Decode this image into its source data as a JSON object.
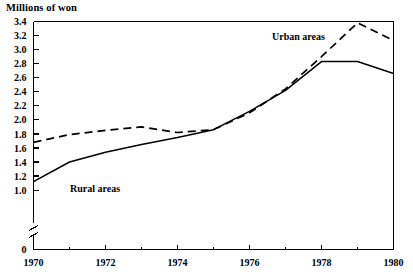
{
  "chart_data": {
    "type": "line",
    "title": "",
    "ylabel": "Millions of won",
    "xlabel": "",
    "xlim": [
      1970,
      1980
    ],
    "ylim": [
      1.0,
      3.4
    ],
    "y_axis_break": true,
    "y_break_between": [
      0,
      1.0
    ],
    "grid": false,
    "legend_position": "inline-annotations",
    "x": [
      1970,
      1971,
      1972,
      1973,
      1974,
      1975,
      1976,
      1977,
      1978,
      1979,
      1980
    ],
    "ytick_labels": [
      "3.4",
      "3.2",
      "3.0",
      "2.8",
      "2.6",
      "2.4",
      "2.2",
      "2.0",
      "1.8",
      "1.6",
      "1.4",
      "1.2",
      "1.0",
      "0"
    ],
    "ytick_values": [
      3.4,
      3.2,
      3.0,
      2.8,
      2.6,
      2.4,
      2.2,
      2.0,
      1.8,
      1.6,
      1.4,
      1.2,
      1.0,
      0
    ],
    "xtick_labels": [
      "1970",
      "1972",
      "1974",
      "1976",
      "1978",
      "1980"
    ],
    "xtick_values": [
      1970,
      1972,
      1974,
      1976,
      1978,
      1980
    ],
    "xminor_tick_values": [
      1971,
      1973,
      1975,
      1977,
      1979
    ],
    "series": [
      {
        "name": "Urban areas",
        "style": "dashed",
        "color": "#000000",
        "label_text": "Urban areas",
        "values": [
          1.68,
          1.79,
          1.85,
          1.9,
          1.82,
          1.86,
          2.1,
          2.44,
          2.9,
          3.38,
          3.13
        ]
      },
      {
        "name": "Rural areas",
        "style": "solid",
        "color": "#000000",
        "label_text": "Rural areas",
        "values": [
          1.12,
          1.4,
          1.54,
          1.65,
          1.75,
          1.86,
          2.12,
          2.42,
          2.83,
          2.83,
          2.66
        ]
      }
    ]
  },
  "annotations": {
    "urban_label": "Urban areas",
    "rural_label": "Rural areas"
  },
  "axis": {
    "y_title": "Millions of won"
  }
}
